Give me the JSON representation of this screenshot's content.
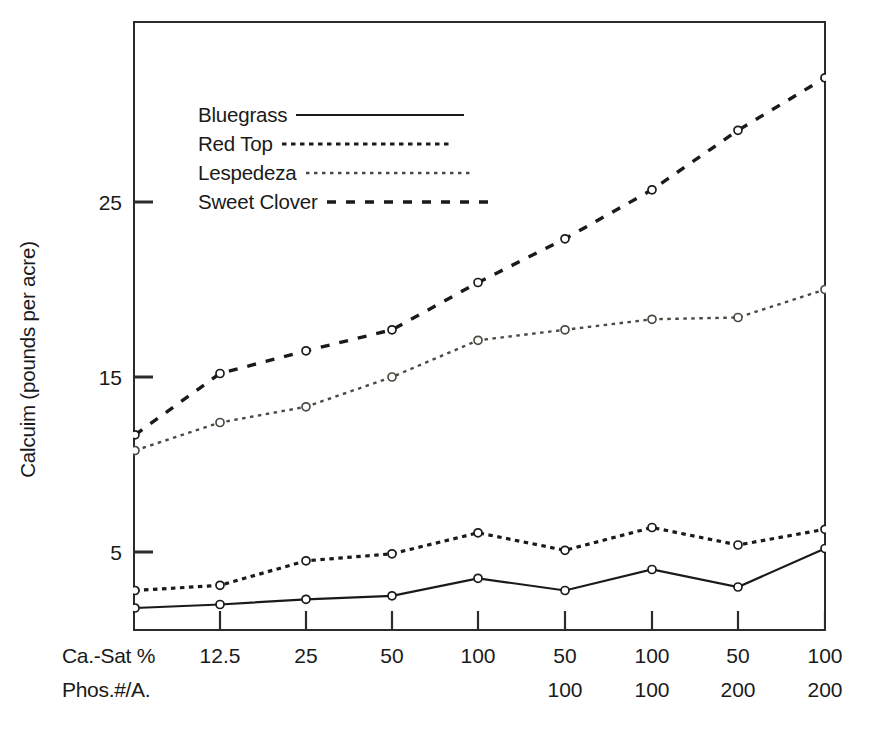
{
  "chart_data": {
    "type": "line",
    "title": "",
    "xlabel": "",
    "ylabel": "Calcuim (pounds per acre)",
    "ylim": [
      0,
      34
    ],
    "yticks": [
      5,
      15,
      25
    ],
    "grid": false,
    "legend_position": "upper-left-inside",
    "x_axis_rows": [
      {
        "name": "Ca.-Sat %",
        "values": [
          "12.5",
          "25",
          "50",
          "100",
          "50",
          "100",
          "50",
          "100"
        ]
      },
      {
        "name": "Phos.#/A.",
        "values": [
          "",
          "",
          "",
          "",
          "100",
          "100",
          "200",
          "200"
        ]
      }
    ],
    "x_positions": [
      0,
      1,
      2,
      3,
      4,
      5,
      6,
      7,
      8
    ],
    "series": [
      {
        "name": "Bluegrass",
        "style": "solid",
        "color": "#1a1a1a",
        "marker": "open-circle",
        "values": [
          1.8,
          2.0,
          2.3,
          2.5,
          3.5,
          2.8,
          4.0,
          3.0,
          5.2
        ]
      },
      {
        "name": "Red Top",
        "style": "dotted",
        "color": "#1a1a1a",
        "marker": "open-circle",
        "values": [
          2.8,
          3.1,
          4.5,
          4.9,
          6.1,
          5.1,
          6.4,
          5.4,
          6.3
        ]
      },
      {
        "name": "Lespedeza",
        "style": "fine-dotted",
        "color": "#4a4a42",
        "marker": "open-circle",
        "values": [
          10.8,
          12.4,
          13.3,
          15.0,
          17.1,
          17.7,
          18.3,
          18.4,
          20.0
        ]
      },
      {
        "name": "Sweet Clover",
        "style": "long-dash",
        "color": "#1a1a1a",
        "marker": "open-circle",
        "values": [
          11.7,
          15.2,
          16.5,
          17.7,
          20.4,
          22.9,
          25.7,
          29.1,
          32.1
        ]
      }
    ]
  },
  "legend": {
    "items": [
      {
        "label": "Bluegrass",
        "style": "solid"
      },
      {
        "label": "Red Top",
        "style": "dotted"
      },
      {
        "label": "Lespedeza",
        "style": "fine-dotted"
      },
      {
        "label": "Sweet Clover",
        "style": "long-dash"
      }
    ]
  },
  "axis": {
    "y_title": "Calcuim (pounds per acre)",
    "y_tick_labels": [
      "25",
      "15",
      "5"
    ]
  }
}
